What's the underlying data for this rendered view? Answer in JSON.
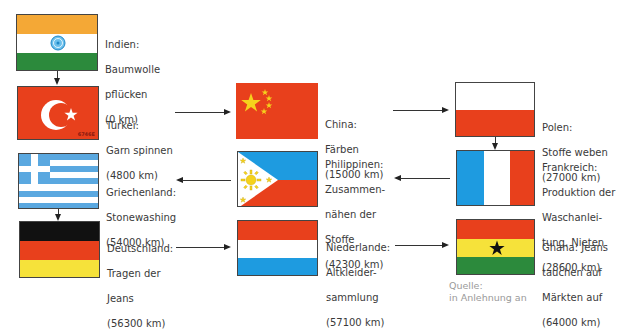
{
  "colors": {
    "red": "#e8401c",
    "saffron": "#f4a836",
    "green": "#2c8a3c",
    "blue_light": "#5aa8e0",
    "blue": "#1e9be0",
    "yellow": "#f6e23a",
    "black": "#111111",
    "gold": "#f5d21c"
  },
  "stations": [
    {
      "country": "Indien:",
      "lines": [
        "Baumwolle",
        "pflücken"
      ],
      "distance": "(0 km)",
      "flag": "india"
    },
    {
      "country": "Türkei:",
      "lines": [
        "Garn spinnen"
      ],
      "distance": "(4800 km)",
      "flag": "turkey",
      "flag_code": "6746E"
    },
    {
      "country": "China:",
      "lines": [
        "Färben"
      ],
      "distance": "(15000 km)",
      "flag": "china"
    },
    {
      "country": "Polen:",
      "lines": [
        "Stoffe weben"
      ],
      "distance": "(27000 km)",
      "flag": "poland"
    },
    {
      "country": "Frankreich:",
      "lines": [
        "Produktion der",
        "Waschanlei-",
        "tung, Nieten"
      ],
      "distance": "(28600 km)",
      "flag": "france"
    },
    {
      "country": "Philippinen:",
      "lines": [
        "Zusammen-",
        "nähen der",
        "Stoffe"
      ],
      "distance": "(42300 km)",
      "flag": "philippines"
    },
    {
      "country": "Griechenland:",
      "lines": [
        "Stonewashing"
      ],
      "distance": "(54000 km)",
      "flag": "greece"
    },
    {
      "country": "Deutschland:",
      "lines": [
        "Tragen der",
        "Jeans"
      ],
      "distance": "(56300 km)",
      "flag": "germany"
    },
    {
      "country": "Niederlande:",
      "lines": [
        "Altkleider-",
        "sammlung"
      ],
      "distance": "(57100 km)",
      "flag": "netherlands"
    },
    {
      "country": "Ghana: Jeans",
      "lines": [
        "tauchen auf",
        "Märkten auf"
      ],
      "distance": "(64000 km)",
      "flag": "ghana"
    }
  ],
  "source": {
    "label": "Quelle:",
    "text": "in Anlehnung an"
  }
}
